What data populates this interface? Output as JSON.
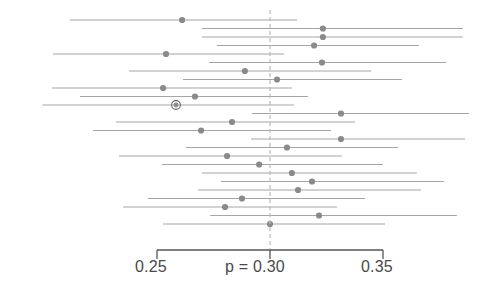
{
  "chart_data": {
    "type": "scatter",
    "subtype": "forest-plot",
    "title": "",
    "xlabel": "",
    "ylabel": "",
    "xlim": [
      0.225,
      0.385
    ],
    "ylim": [
      0,
      22
    ],
    "grid": false,
    "legend": null,
    "reference_line": {
      "value": 0.3,
      "label": "p = 0.30",
      "style": "dashed",
      "color": "#b9b9b9"
    },
    "axis": {
      "ticks": [
        0.25,
        0.3,
        0.35
      ],
      "tick_labels": [
        "0.25",
        "p = 0.30",
        "0.35"
      ],
      "tick_pixel_positions": [
        157,
        270,
        383
      ],
      "axis_color": "#555555"
    },
    "marker_color": "#8a8a8a",
    "line_color": "#9b9b9b",
    "highlight_marker_color": "#8a8a8a",
    "highlight_ring_color": "#666666",
    "points": [
      {
        "index": 1,
        "estimate": 0.2611,
        "ci_low": 0.2115,
        "ci_high": 0.312,
        "highlighted": false
      },
      {
        "index": 2,
        "estimate": 0.3234,
        "ci_low": 0.2699,
        "ci_high": 0.3853,
        "highlighted": false
      },
      {
        "index": 3,
        "estimate": 0.3234,
        "ci_low": 0.2699,
        "ci_high": 0.3853,
        "highlighted": false
      },
      {
        "index": 4,
        "estimate": 0.3195,
        "ci_low": 0.2765,
        "ci_high": 0.3659,
        "highlighted": false
      },
      {
        "index": 5,
        "estimate": 0.254,
        "ci_low": 0.204,
        "ci_high": 0.3062,
        "highlighted": false
      },
      {
        "index": 6,
        "estimate": 0.323,
        "ci_low": 0.273,
        "ci_high": 0.3779,
        "highlighted": false
      },
      {
        "index": 7,
        "estimate": 0.2889,
        "ci_low": 0.2376,
        "ci_high": 0.3447,
        "highlighted": false
      },
      {
        "index": 8,
        "estimate": 0.3031,
        "ci_low": 0.2615,
        "ci_high": 0.3584,
        "highlighted": false
      },
      {
        "index": 9,
        "estimate": 0.2527,
        "ci_low": 0.2035,
        "ci_high": 0.3097,
        "highlighted": false
      },
      {
        "index": 10,
        "estimate": 0.2668,
        "ci_low": 0.2159,
        "ci_high": 0.3168,
        "highlighted": false
      },
      {
        "index": 11,
        "estimate": 0.2584,
        "ci_low": 0.1993,
        "ci_high": 0.3106,
        "highlighted": true
      },
      {
        "index": 12,
        "estimate": 0.3314,
        "ci_low": 0.292,
        "ci_high": 0.388,
        "highlighted": false
      },
      {
        "index": 13,
        "estimate": 0.2832,
        "ci_low": 0.2319,
        "ci_high": 0.3376,
        "highlighted": false
      },
      {
        "index": 14,
        "estimate": 0.2695,
        "ci_low": 0.2217,
        "ci_high": 0.327,
        "highlighted": false
      },
      {
        "index": 15,
        "estimate": 0.3314,
        "ci_low": 0.2916,
        "ci_high": 0.3863,
        "highlighted": false
      },
      {
        "index": 16,
        "estimate": 0.3075,
        "ci_low": 0.2629,
        "ci_high": 0.3566,
        "highlighted": false
      },
      {
        "index": 17,
        "estimate": 0.281,
        "ci_low": 0.2332,
        "ci_high": 0.3318,
        "highlighted": false
      },
      {
        "index": 18,
        "estimate": 0.2952,
        "ci_low": 0.2522,
        "ci_high": 0.35,
        "highlighted": false
      },
      {
        "index": 19,
        "estimate": 0.3097,
        "ci_low": 0.2699,
        "ci_high": 0.365,
        "highlighted": false
      },
      {
        "index": 20,
        "estimate": 0.3186,
        "ci_low": 0.2783,
        "ci_high": 0.377,
        "highlighted": false
      },
      {
        "index": 21,
        "estimate": 0.3124,
        "ci_low": 0.2681,
        "ci_high": 0.3668,
        "highlighted": false
      },
      {
        "index": 22,
        "estimate": 0.2876,
        "ci_low": 0.246,
        "ci_high": 0.342,
        "highlighted": false
      },
      {
        "index": 23,
        "estimate": 0.2801,
        "ci_low": 0.235,
        "ci_high": 0.3296,
        "highlighted": false
      },
      {
        "index": 24,
        "estimate": 0.3217,
        "ci_low": 0.2735,
        "ci_high": 0.3827,
        "highlighted": false
      },
      {
        "index": 25,
        "estimate": 0.3,
        "ci_low": 0.2527,
        "ci_high": 0.3509,
        "highlighted": false
      }
    ]
  },
  "axis_labels": {
    "left": "0.25",
    "center": "p = 0.30",
    "right": "0.35"
  }
}
